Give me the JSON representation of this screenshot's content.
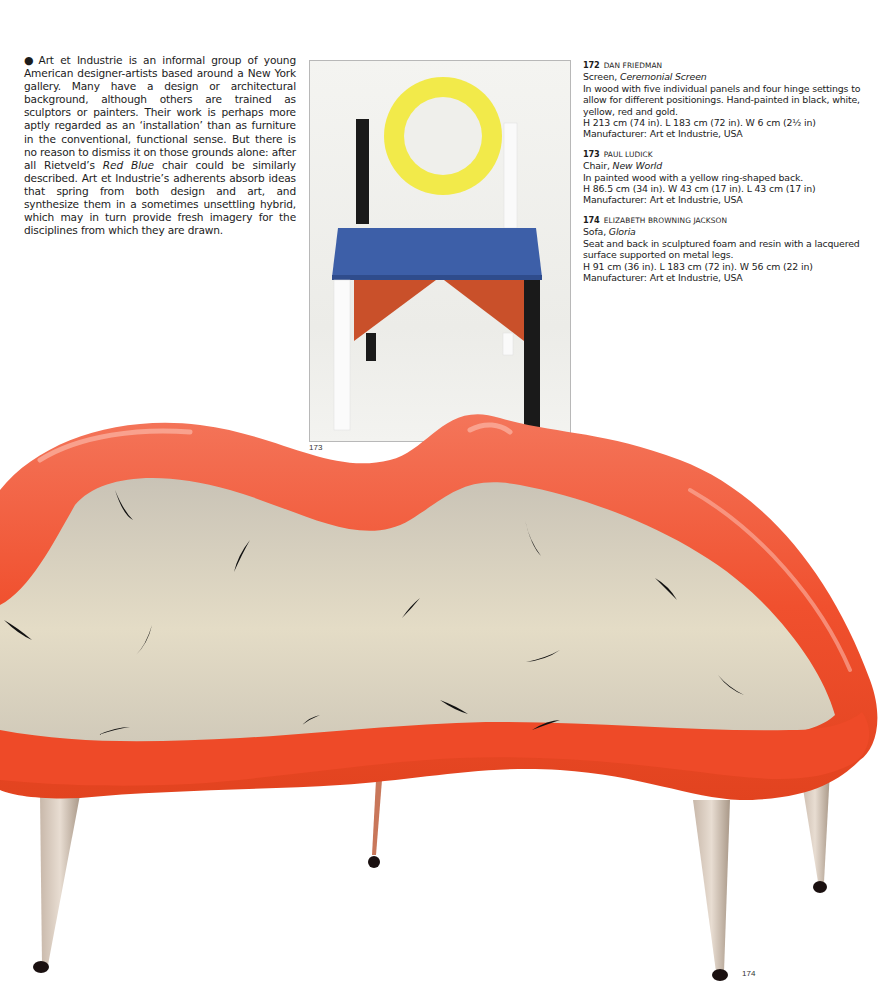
{
  "intro": {
    "bullet": "●",
    "text_before_italic": "Art et Industrie is an informal group of young American designer-artists based around a New York gallery. Many have a design or architectural background, although others are trained as sculptors or painters. Their work is perhaps more aptly regarded as an ‘installation’ than as furniture in the conventional, functional sense. But there is no reason to dismiss it on those grounds alone: after all Rietveld’s ",
    "italic": "Red Blue",
    "text_after_italic": " chair could be similarly described. Art et Industrie’s adherents absorb ideas that spring from both design and art, and synthesize them in a sometimes unsettling hybrid, which may in turn provide fresh imagery for the disciplines from which they are drawn."
  },
  "captions": [
    {
      "number": "172",
      "designer": "DAN FRIEDMAN",
      "type": "Screen, ",
      "title": "Ceremonial Screen",
      "description": "In wood with five individual panels and four hinge settings to allow for different positionings. Hand-painted in black, white, yellow, red and gold.",
      "dimensions": "H 213 cm (74 in). L 183 cm (72 in). W 6 cm (2½ in)",
      "manufacturer": "Manufacturer: Art et Industrie, USA"
    },
    {
      "number": "173",
      "designer": "PAUL LUDICK",
      "type": "Chair, ",
      "title": "New World",
      "description": "In painted wood with a yellow ring-shaped back.",
      "dimensions": "H 86.5 cm (34 in). W 43 cm (17 in). L 43 cm (17 in)",
      "manufacturer": "Manufacturer: Art et Industrie, USA"
    },
    {
      "number": "174",
      "designer": "ELIZABETH BROWNING JACKSON",
      "type": "Sofa, ",
      "title": "Gloria",
      "description": "Seat and back in sculptured foam and resin with a lacquered surface supported on metal legs.",
      "dimensions": "H 91 cm (36 in). L 183 cm (72 in). W 56 cm (22 in)",
      "manufacturer": "Manufacturer: Art et Industrie, USA"
    }
  ],
  "figures": {
    "chair_label": "173",
    "sofa_label": "174"
  },
  "colors": {
    "sofa_red": "#f0502e",
    "sofa_inner": "#d9d1c0",
    "chair_yellow": "#f2ea4a",
    "chair_blue": "#3d5fa8",
    "chair_red": "#c9502a",
    "chair_black": "#1a1a1a"
  }
}
